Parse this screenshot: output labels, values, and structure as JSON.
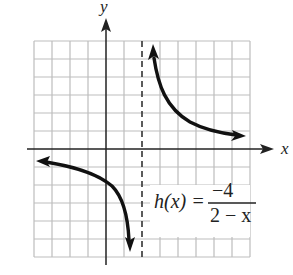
{
  "graph": {
    "x_axis_label": "x",
    "y_axis_label": "y",
    "grid": {
      "x_min": -4,
      "x_max": 8,
      "y_min": -6,
      "y_max": 6,
      "step": 1
    },
    "asymptote": {
      "type": "vertical",
      "x": 2,
      "style": "dashed"
    },
    "function": {
      "name": "h(x) =",
      "numerator": "−4",
      "denominator": "2 − x"
    },
    "colors": {
      "grid": "#bdbdbd",
      "axis": "#222222",
      "curve": "#111111"
    }
  }
}
